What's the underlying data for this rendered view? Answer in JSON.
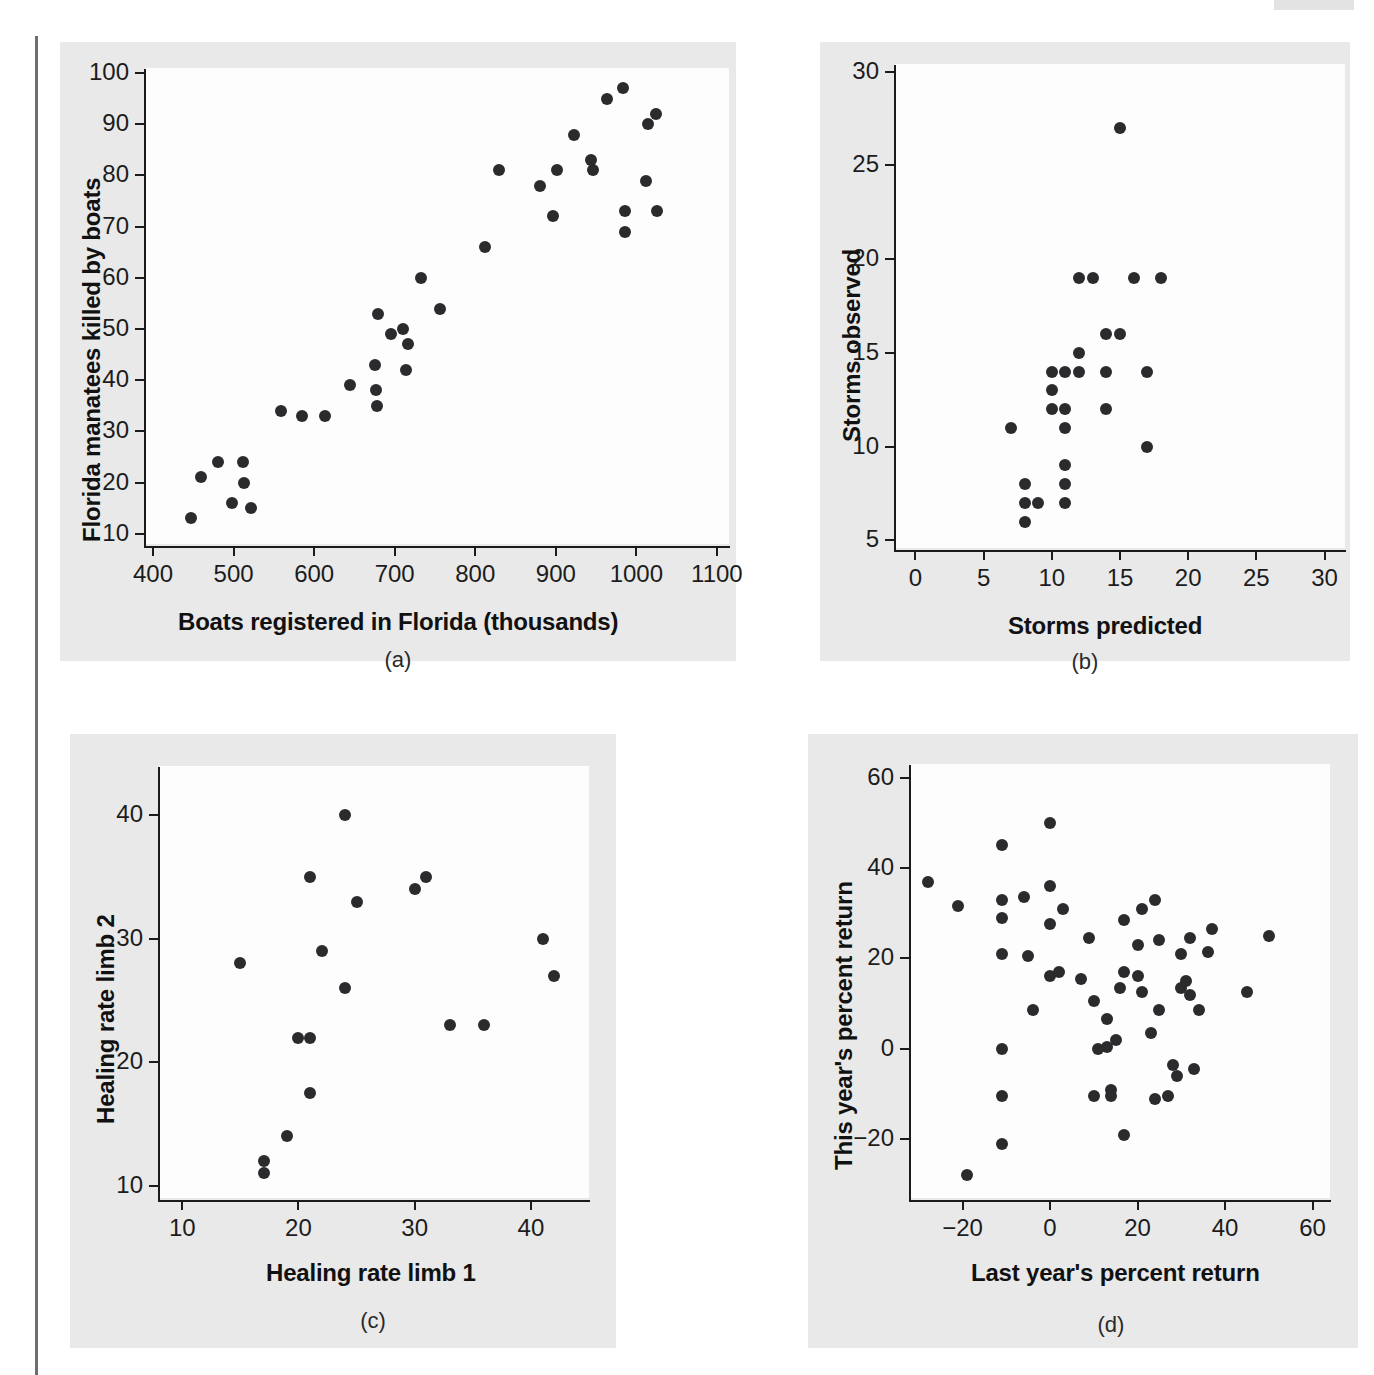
{
  "figure": {
    "panel_bg": "#e9e9e9",
    "plot_bg": "#fdfdfd",
    "dot_color": "#2b2b2e",
    "axis_color": "#1b1b1b"
  },
  "chart_data": [
    {
      "id": "a",
      "type": "scatter",
      "title": "",
      "caption": "(a)",
      "xlabel": "Boats registered in Florida (thousands)",
      "ylabel": "Florida manatees killed by boats",
      "xlim": [
        390,
        1115
      ],
      "ylim": [
        8,
        101
      ],
      "xticks": [
        400,
        500,
        600,
        700,
        800,
        900,
        1000,
        1100
      ],
      "yticks": [
        10,
        20,
        30,
        40,
        50,
        60,
        70,
        80,
        90,
        100
      ],
      "grid": false,
      "legend": "none",
      "points": [
        [
          447,
          13
        ],
        [
          460,
          21
        ],
        [
          481,
          24
        ],
        [
          498,
          16
        ],
        [
          512,
          24
        ],
        [
          513,
          20
        ],
        [
          521,
          15
        ],
        [
          559,
          34
        ],
        [
          585,
          33
        ],
        [
          614,
          33
        ],
        [
          645,
          39
        ],
        [
          675,
          43
        ],
        [
          677,
          38
        ],
        [
          678,
          35
        ],
        [
          679,
          53
        ],
        [
          696,
          49
        ],
        [
          710,
          50
        ],
        [
          714,
          42
        ],
        [
          716,
          47
        ],
        [
          733,
          60
        ],
        [
          756,
          54
        ],
        [
          812,
          66
        ],
        [
          830,
          81
        ],
        [
          880,
          78
        ],
        [
          897,
          72
        ],
        [
          902,
          81
        ],
        [
          922,
          88
        ],
        [
          944,
          83
        ],
        [
          946,
          81
        ],
        [
          963,
          95
        ],
        [
          984,
          97
        ],
        [
          986,
          73
        ],
        [
          986,
          69
        ],
        [
          1012,
          79
        ],
        [
          1014,
          90
        ],
        [
          1024,
          92
        ],
        [
          1026,
          73
        ]
      ]
    },
    {
      "id": "b",
      "type": "scatter",
      "title": "",
      "caption": "(b)",
      "xlabel": "Storms predicted",
      "ylabel": "Storms observed",
      "xlim": [
        -1.5,
        31.5
      ],
      "ylim": [
        4.6,
        30.4
      ],
      "xticks": [
        0,
        5,
        10,
        15,
        20,
        25,
        30
      ],
      "yticks": [
        5,
        10,
        15,
        20,
        25,
        30
      ],
      "grid": false,
      "legend": "none",
      "points": [
        [
          7,
          11
        ],
        [
          8,
          8
        ],
        [
          8,
          7
        ],
        [
          8,
          6
        ],
        [
          9,
          7
        ],
        [
          10,
          14
        ],
        [
          10,
          13
        ],
        [
          10,
          12
        ],
        [
          11,
          14
        ],
        [
          11,
          12
        ],
        [
          11,
          11
        ],
        [
          11,
          9
        ],
        [
          11,
          8
        ],
        [
          11,
          7
        ],
        [
          12,
          19
        ],
        [
          12,
          15
        ],
        [
          12,
          14
        ],
        [
          13,
          19
        ],
        [
          14,
          16
        ],
        [
          14,
          14
        ],
        [
          14,
          12
        ],
        [
          15,
          27
        ],
        [
          15,
          16
        ],
        [
          16,
          19
        ],
        [
          17,
          14
        ],
        [
          17,
          10
        ],
        [
          18,
          19
        ]
      ]
    },
    {
      "id": "c",
      "type": "scatter",
      "title": "",
      "caption": "(c)",
      "xlabel": "Healing rate limb 1",
      "ylabel": "Healing rate limb 2",
      "xlim": [
        8,
        45
      ],
      "ylim": [
        9,
        44
      ],
      "xticks": [
        10,
        20,
        30,
        40
      ],
      "yticks": [
        10,
        20,
        30,
        40
      ],
      "grid": false,
      "legend": "none",
      "points": [
        [
          15,
          28
        ],
        [
          17,
          12
        ],
        [
          17,
          11
        ],
        [
          19,
          14
        ],
        [
          20,
          22
        ],
        [
          21,
          35
        ],
        [
          21,
          22
        ],
        [
          21,
          17.5
        ],
        [
          22,
          29
        ],
        [
          24,
          40
        ],
        [
          24,
          26
        ],
        [
          25,
          33
        ],
        [
          30,
          34
        ],
        [
          31,
          35
        ],
        [
          33,
          23
        ],
        [
          36,
          23
        ],
        [
          41,
          30
        ],
        [
          42,
          27
        ]
      ]
    },
    {
      "id": "d",
      "type": "scatter",
      "title": "",
      "caption": "(d)",
      "xlabel": "Last year's percent return",
      "ylabel": "This year's percent return",
      "xlim": [
        -32,
        64
      ],
      "ylim": [
        -33,
        63
      ],
      "xticks": [
        -20,
        0,
        20,
        40,
        60
      ],
      "yticks": [
        -20,
        0,
        20,
        40,
        60
      ],
      "grid": false,
      "legend": "none",
      "points": [
        [
          -28,
          37
        ],
        [
          -21,
          31.5
        ],
        [
          -19,
          -28
        ],
        [
          -11,
          45
        ],
        [
          -11,
          33
        ],
        [
          -11,
          29
        ],
        [
          -11,
          21
        ],
        [
          -11,
          0
        ],
        [
          -11,
          -10.5
        ],
        [
          -11,
          -21
        ],
        [
          -6,
          33.5
        ],
        [
          -5,
          20.5
        ],
        [
          -4,
          8.5
        ],
        [
          0,
          50
        ],
        [
          0,
          36
        ],
        [
          0,
          27.5
        ],
        [
          0,
          16
        ],
        [
          2,
          17
        ],
        [
          3,
          31
        ],
        [
          7,
          15.5
        ],
        [
          9,
          24.5
        ],
        [
          10,
          10.5
        ],
        [
          10,
          -10.5
        ],
        [
          11,
          0
        ],
        [
          13,
          0.5
        ],
        [
          13,
          6.5
        ],
        [
          14,
          -9
        ],
        [
          14,
          -10.5
        ],
        [
          15,
          2
        ],
        [
          16,
          13.5
        ],
        [
          17,
          17
        ],
        [
          17,
          28.5
        ],
        [
          17,
          -19
        ],
        [
          20,
          16
        ],
        [
          20,
          23
        ],
        [
          21,
          31
        ],
        [
          21,
          12.5
        ],
        [
          23,
          3.5
        ],
        [
          24,
          33
        ],
        [
          24,
          -11
        ],
        [
          25,
          24
        ],
        [
          25,
          8.5
        ],
        [
          27,
          -10.5
        ],
        [
          28,
          -3.5
        ],
        [
          29,
          -6
        ],
        [
          30,
          13.5
        ],
        [
          30,
          21
        ],
        [
          31,
          15
        ],
        [
          32,
          12
        ],
        [
          32,
          24.5
        ],
        [
          33,
          -4.5
        ],
        [
          34,
          8.5
        ],
        [
          36,
          21.5
        ],
        [
          37,
          26.5
        ],
        [
          45,
          12.5
        ],
        [
          50,
          25
        ]
      ]
    }
  ]
}
